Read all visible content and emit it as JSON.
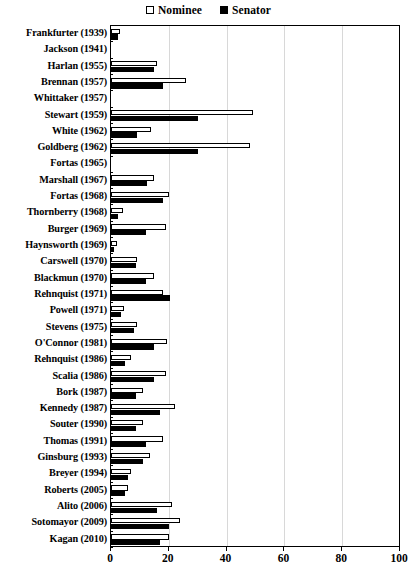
{
  "chart_data": {
    "type": "bar",
    "orientation": "horizontal",
    "title": "",
    "subtitle": "",
    "xlabel": "",
    "ylabel": "",
    "xlim": [
      0,
      100
    ],
    "xticks": [
      0,
      20,
      40,
      60,
      80,
      100
    ],
    "xtick_labels": [
      "0",
      "20",
      "40",
      "60",
      "80",
      "100"
    ],
    "grid": "vertical",
    "legend_position": "top-center",
    "legend": [
      {
        "name": "Nominee",
        "marker": "open-square",
        "color": "#ffffff"
      },
      {
        "name": "Senator",
        "marker": "filled-square",
        "color": "#000000"
      }
    ],
    "categories": [
      "Frankfurter (1939)",
      "Jackson (1941)",
      "Harlan (1955)",
      "Brennan (1957)",
      "Whittaker (1957)",
      "Stewart (1959)",
      "White (1962)",
      "Goldberg (1962)",
      "Fortas (1965)",
      "Marshall (1967)",
      "Fortas (1968)",
      "Thornberry (1968)",
      "Burger (1969)",
      "Haynsworth (1969)",
      "Carswell (1970)",
      "Blackmun (1970)",
      "Rehnquist (1971)",
      "Powell (1971)",
      "Stevens (1975)",
      "O'Connor (1981)",
      "Rehnquist (1986)",
      "Scalia (1986)",
      "Bork (1987)",
      "Kennedy (1987)",
      "Souter (1990)",
      "Thomas (1991)",
      "Ginsburg (1993)",
      "Breyer (1994)",
      "Roberts (2005)",
      "Alito (2006)",
      "Sotomayor (2009)",
      "Kagan (2010)"
    ],
    "series": [
      {
        "name": "Nominee",
        "values": [
          3,
          0,
          16,
          26,
          0,
          49,
          14,
          48,
          0,
          15,
          20,
          4,
          19,
          2,
          9,
          15,
          18,
          4.5,
          9,
          19.5,
          7,
          19,
          11,
          22,
          11,
          18,
          13.5,
          7,
          6,
          21,
          24,
          20
        ]
      },
      {
        "name": "Senator",
        "values": [
          2.5,
          0,
          15,
          18,
          0,
          30,
          9,
          30,
          0,
          12.5,
          18,
          2.5,
          12,
          1,
          8.5,
          12,
          20.5,
          3.5,
          8,
          15,
          5,
          15,
          8.5,
          17,
          8.5,
          12,
          11,
          6,
          5,
          16,
          20,
          17
        ]
      }
    ]
  }
}
